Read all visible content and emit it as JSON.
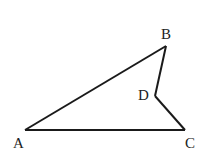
{
  "figure": {
    "type": "quadrilateral (concave)",
    "stroke_color": "#1a1a1a",
    "background": "#ffffff",
    "vertices": {
      "A": {
        "label": "A",
        "x": 25,
        "y": 130
      },
      "B": {
        "label": "B",
        "x": 166,
        "y": 46
      },
      "D": {
        "label": "D",
        "x": 155,
        "y": 96
      },
      "C": {
        "label": "C",
        "x": 185,
        "y": 130
      }
    },
    "segments": [
      "AB",
      "BD",
      "DC",
      "CA"
    ]
  }
}
